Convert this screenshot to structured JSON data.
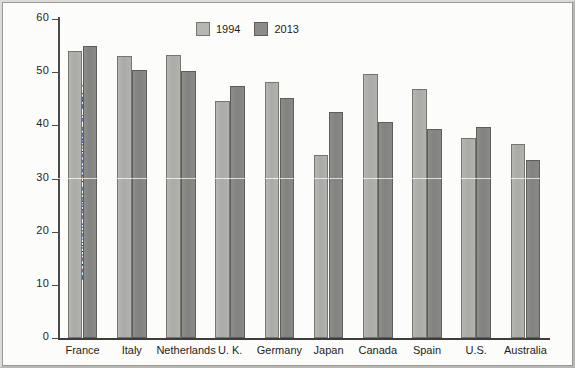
{
  "chart_data": {
    "type": "bar",
    "title": "",
    "xlabel": "",
    "ylabel": "Government outlays (percentage of GDP)",
    "ylim": [
      0,
      60
    ],
    "yticks": [
      0,
      10,
      20,
      30,
      40,
      50,
      60
    ],
    "ytick_labels": [
      "0",
      "10",
      "20",
      "30",
      "40",
      "50",
      "60"
    ],
    "grid": false,
    "legend_position": "top-center",
    "categories": [
      "France",
      "Italy",
      "Netherlands",
      "U. K.",
      "Germany",
      "Japan",
      "Canada",
      "Spain",
      "U.S.",
      "Australia"
    ],
    "series": [
      {
        "name": "1994",
        "color": "#b6b6b2",
        "values": [
          54.0,
          53.0,
          53.3,
          44.5,
          48.1,
          34.5,
          49.7,
          46.8,
          37.6,
          36.4
        ]
      },
      {
        "name": "2013",
        "color": "#8b8b88",
        "values": [
          54.9,
          50.4,
          50.2,
          47.4,
          45.1,
          42.5,
          40.6,
          39.4,
          39.6,
          33.4
        ]
      }
    ]
  },
  "legend": {
    "items": [
      {
        "label": "1994",
        "swatch": "light-gray-swatch"
      },
      {
        "label": "2013",
        "swatch": "dark-gray-swatch"
      }
    ]
  }
}
